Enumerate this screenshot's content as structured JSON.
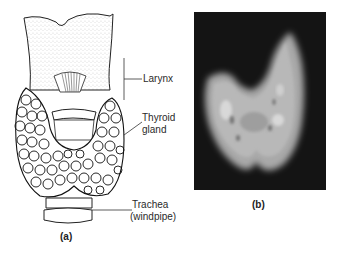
{
  "figure": {
    "panel_a": {
      "caption": "(a)",
      "labels": {
        "larynx": "Larynx",
        "thyroid_line1": "Thyroid",
        "thyroid_line2": "gland",
        "trachea_line1": "Trachea",
        "trachea_line2": "(windpipe)"
      }
    },
    "panel_b": {
      "caption": "(b)"
    },
    "colors": {
      "ink": "#222222",
      "scan_background": "#141414",
      "scan_tissue": "#b8b8b8"
    }
  }
}
